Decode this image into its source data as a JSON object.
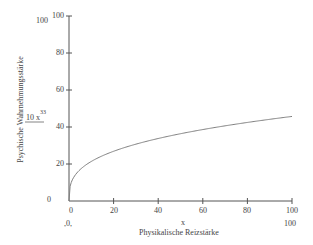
{
  "chart_data": {
    "type": "line",
    "title": "",
    "xlabel": "Physikalische Reizstärke",
    "ylabel": "Psychische Wahrnehmungsstärke",
    "function_label": "10 x^33",
    "function_label_base": "10 x",
    "function_label_exp": "33",
    "x_var_label": "x",
    "xlim": [
      0,
      100
    ],
    "ylim": [
      0,
      100
    ],
    "x_range_min_label": ",0,",
    "x_range_max_label": "100",
    "y_range_min_label": "0",
    "y_range_max_label": "100",
    "xticks": [
      "0",
      "20",
      "40",
      "60",
      "80",
      "100"
    ],
    "yticks": [
      "20",
      "40",
      "60",
      "80",
      "100"
    ],
    "grid": false,
    "legend": "none",
    "series": [
      {
        "name": "10 x^0.33",
        "x": [
          0,
          1,
          5,
          10,
          20,
          30,
          40,
          50,
          60,
          70,
          80,
          90,
          100
        ],
        "values": [
          0,
          10,
          17.0,
          21.4,
          26.9,
          30.7,
          33.8,
          36.4,
          38.6,
          40.6,
          42.5,
          44.2,
          45.7
        ],
        "color": "#808080"
      }
    ]
  }
}
